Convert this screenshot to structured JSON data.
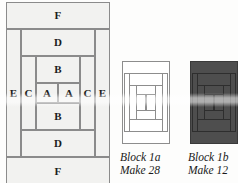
{
  "figure": {
    "kind": "quilt-block-piecing-diagram",
    "colors": {
      "patch_fill": "#f2f2f0",
      "patch_stroke": "#8b8b8b",
      "dark_block_fill": "#4e4e4e",
      "dark_block_stroke": "#2e2e2e",
      "light_block_fill": "#ffffff",
      "text": "#1c1c1c",
      "paper": "#fdfdfc"
    }
  },
  "piecing_diagram": {
    "name": "labelled-piece-layout",
    "description": "Concentric log-cabin style patch layout, symmetric top-to-bottom and left-to-right",
    "rows": [
      {
        "label": "F",
        "position": "top"
      },
      {
        "label": "D",
        "position": "upper"
      },
      {
        "label": "B",
        "position": "inner-upper"
      },
      {
        "label": "B",
        "position": "inner-lower"
      },
      {
        "label": "D",
        "position": "lower"
      },
      {
        "label": "F",
        "position": "bottom"
      }
    ],
    "center_row": {
      "cells": [
        "E",
        "C",
        "A",
        "A",
        "C",
        "E"
      ]
    },
    "patches": {
      "f_top": "F",
      "f_bottom": "F",
      "d_top": "D",
      "d_bottom": "D",
      "b_top": "B",
      "b_bottom": "B",
      "e_left": "E",
      "e_right": "E",
      "c_left": "C",
      "c_right": "C",
      "a_left": "A",
      "a_right": "A"
    }
  },
  "blocks": [
    {
      "id": "block-1a",
      "variant": "light",
      "title": "Block 1a",
      "quantity": "Make 28"
    },
    {
      "id": "block-1b",
      "variant": "dark",
      "title": "Block 1b",
      "quantity": "Make 12"
    }
  ]
}
